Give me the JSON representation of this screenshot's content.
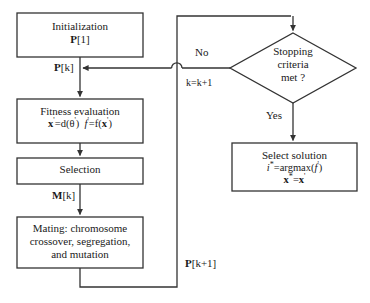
{
  "diagram": {
    "stroke_color": "#333333",
    "text_color": "#1a1a1a",
    "background": "#ffffff"
  },
  "nodes": {
    "initialization": {
      "shape": "process",
      "line1": "Initialization",
      "line2_bold": "P",
      "line2_rest": "[1]"
    },
    "fitness": {
      "shape": "process",
      "line1": "Fitness evaluation",
      "line2_a_bold": "x",
      "line2_a_prime": "'",
      "line2_b": "=d(θ",
      "line2_b_prime": "'",
      "line2_c": ")",
      "line2_d_italic": "f",
      "line2_d_prime": "'",
      "line2_e": "=f(",
      "line2_f_bold": "x",
      "line2_f_prime": "'",
      "line2_g": ")"
    },
    "selection": {
      "shape": "process",
      "line1": "Selection"
    },
    "mating": {
      "shape": "process",
      "line1": "Mating: chromosome",
      "line2": "crossover, segregation,",
      "line3": "and mutation"
    },
    "stopping": {
      "shape": "decision",
      "line1": "Stopping",
      "line2": "criteria",
      "line3": "met ?"
    },
    "select_solution": {
      "shape": "process",
      "line1": "Select solution",
      "line2_i": "i",
      "line2_star": "*",
      "line2_rest": "=argmax(",
      "line2_f": "f",
      "line2_fprime": "'",
      "line2_close": ")",
      "line3_x": "x",
      "line3_star": "*",
      "line3_eq": "=",
      "line3_x2": "x",
      "line3_prime": "'"
    }
  },
  "edge_labels": {
    "pk_bold": "P",
    "pk_rest": "[k]",
    "mk_bold": "M",
    "mk_rest": "[k]",
    "pk1_bold": "P",
    "pk1_rest": "[k+1]",
    "no": "No",
    "increment": "k=k+1",
    "yes": "Yes"
  }
}
